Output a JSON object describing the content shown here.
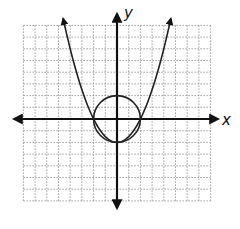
{
  "chart_data": {
    "type": "line",
    "title": "",
    "xlabel": "x",
    "ylabel": "y",
    "xlim": [
      -8,
      8
    ],
    "ylim": [
      -7,
      8
    ],
    "grid": true,
    "grid_style": "dotted",
    "tick_labels": false,
    "series": [
      {
        "name": "parabola",
        "kind": "function",
        "equation": "y = 0.5x^2 - 2",
        "vertex": [
          0,
          -2
        ],
        "x_intercepts": [
          -2,
          2
        ],
        "x_range": [
          -4.6,
          4.6
        ],
        "arrows": "both ends"
      },
      {
        "name": "circle",
        "kind": "circle",
        "equation": "x^2 + y^2 = 4",
        "center": [
          0,
          0
        ],
        "radius": 2
      }
    ],
    "intersections": [
      [
        -2,
        0
      ],
      [
        2,
        0
      ],
      [
        0,
        -2
      ]
    ]
  },
  "labels": {
    "x_axis": "x",
    "y_axis": "y"
  },
  "colors": {
    "axis": "#111111",
    "curve": "#222222",
    "grid": "#888888",
    "background": "#ffffff"
  }
}
